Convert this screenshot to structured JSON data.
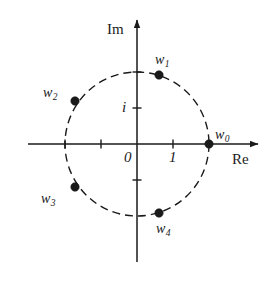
{
  "figure": {
    "kind": "complex-plane-roots-diagram",
    "background_color": "#ffffff",
    "ink_color": "#1a1a1a",
    "width": 276,
    "height": 282
  },
  "axes": {
    "real": {
      "label": "Re",
      "label_x": 232,
      "label_y": 152,
      "line_y": 144,
      "line_x1": 28,
      "line_x2": 258,
      "arrow": "right"
    },
    "imaginary": {
      "label": "Im",
      "label_x": 107,
      "label_y": 22,
      "line_x": 137,
      "line_y1": 20,
      "line_y2": 262,
      "arrow": "up"
    },
    "origin": {
      "label": "0",
      "label_x": 124,
      "label_y": 150,
      "x": 137,
      "y": 144
    }
  },
  "ticks": {
    "real": [
      {
        "label": "",
        "value": -2,
        "x": 65
      },
      {
        "label": "",
        "value": -1,
        "x": 101
      },
      {
        "label": "1",
        "value": 1,
        "x": 173,
        "label_x": 169,
        "label_y": 150
      }
    ],
    "imaginary": [
      {
        "label": "i",
        "value": 1,
        "y": 108,
        "label_x": 122,
        "label_y": 100
      },
      {
        "label": "",
        "value": 2,
        "y": 72
      },
      {
        "label": "",
        "value": -1,
        "y": 180
      }
    ]
  },
  "circle": {
    "center_x": 137,
    "center_y": 144,
    "radius_px": 72,
    "radius_units": 2,
    "style": "dashed",
    "dash_pattern": "8 5",
    "stroke_width": 1.4
  },
  "chart_data": {
    "type": "scatter",
    "title": "",
    "xlabel": "Re",
    "ylabel": "Im",
    "xlim": [
      -2.6,
      2.6
    ],
    "ylim": [
      -2.6,
      2.6
    ],
    "grid": false,
    "legend": false,
    "points": [
      {
        "name": "w0",
        "label": "w",
        "subscript": "0",
        "angle_deg": 0,
        "re": 2.0,
        "im": 0.0,
        "x": 209,
        "y": 144,
        "label_x": 215,
        "label_y": 128
      },
      {
        "name": "w1",
        "label": "w",
        "subscript": "1",
        "angle_deg": 72,
        "re": 0.618,
        "im": 1.902,
        "x": 159,
        "y": 75,
        "label_x": 155,
        "label_y": 53
      },
      {
        "name": "w2",
        "label": "w",
        "subscript": "2",
        "angle_deg": 144,
        "re": -1.618,
        "im": 1.176,
        "x": 75,
        "y": 101,
        "label_x": 43,
        "label_y": 86
      },
      {
        "name": "w3",
        "label": "w",
        "subscript": "3",
        "angle_deg": 216,
        "re": -1.618,
        "im": -1.176,
        "x": 75,
        "y": 187,
        "label_x": 41,
        "label_y": 192
      },
      {
        "name": "w4",
        "label": "w",
        "subscript": "4",
        "angle_deg": 288,
        "re": 0.618,
        "im": -1.902,
        "x": 159,
        "y": 213,
        "label_x": 156,
        "label_y": 222
      }
    ],
    "point_radius_px": 4.2
  }
}
